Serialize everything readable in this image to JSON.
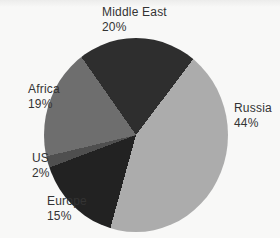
{
  "chart_data": {
    "type": "pie",
    "categories": [
      "Middle East",
      "Russia",
      "Europe",
      "US",
      "Africa"
    ],
    "values": [
      20,
      44,
      15,
      2,
      19
    ],
    "unit": "percent",
    "colors": [
      "#2e2e2e",
      "#acacac",
      "#222222",
      "#4f4f4f",
      "#6e6e6e"
    ],
    "start_angle_from_top_deg": -35,
    "direction": "clockwise",
    "title": "",
    "legend_position": "none",
    "label_style": "category name and percent placed outside slices, no leader lines"
  },
  "labels": {
    "middle_east": {
      "name": "Middle East",
      "value": "20%"
    },
    "russia": {
      "name": "Russia",
      "value": "44%"
    },
    "africa": {
      "name": "Africa",
      "value": "19%"
    },
    "us": {
      "name": "US",
      "value": "2%"
    },
    "europe": {
      "name": "Europe",
      "value": "15%"
    }
  }
}
